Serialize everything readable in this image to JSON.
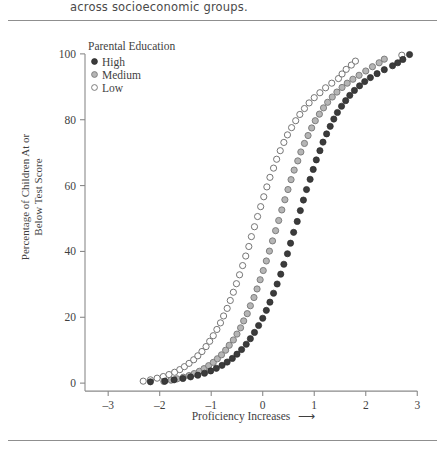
{
  "page": {
    "header_text": "across socioeconomic groups."
  },
  "chart_data": {
    "type": "scatter",
    "title": "",
    "xlabel": "Proficiency Increases",
    "xlabel_arrow": "⟶",
    "ylabel_line1": "Percentage of Children At or",
    "ylabel_line2": "Below Test Score",
    "xlim": [
      -3.45,
      3.15
    ],
    "ylim": [
      -3,
      103
    ],
    "xticks": [
      -3,
      -2,
      -1,
      0,
      1,
      2,
      3
    ],
    "xticklabels": [
      "–3",
      "–2",
      "–1",
      "0",
      "1",
      "2",
      "3"
    ],
    "yticks": [
      0,
      20,
      40,
      60,
      80,
      100
    ],
    "yticklabels": [
      "0",
      "20",
      "40",
      "60",
      "80",
      "100"
    ],
    "grid": false,
    "legend_title": "Parental Education",
    "legend_position": "upper-left-inside",
    "marker_radius": 3.1,
    "series": [
      {
        "name": "High",
        "marker": "filled-dark-circle",
        "fill": "#3b3b3b",
        "stroke": "#2b2b2b",
        "points": [
          [
            -2.18,
            0.4
          ],
          [
            -1.9,
            0.6
          ],
          [
            -1.72,
            1.0
          ],
          [
            -1.55,
            1.4
          ],
          [
            -1.4,
            1.9
          ],
          [
            -1.26,
            2.4
          ],
          [
            -1.13,
            3.0
          ],
          [
            -1.01,
            3.7
          ],
          [
            -0.9,
            4.5
          ],
          [
            -0.79,
            5.4
          ],
          [
            -0.69,
            6.4
          ],
          [
            -0.59,
            7.5
          ],
          [
            -0.5,
            8.8
          ],
          [
            -0.41,
            10.2
          ],
          [
            -0.32,
            11.8
          ],
          [
            -0.24,
            13.5
          ],
          [
            -0.16,
            15.4
          ],
          [
            -0.08,
            17.5
          ],
          [
            0.0,
            19.7
          ],
          [
            0.07,
            22.1
          ],
          [
            0.14,
            24.6
          ],
          [
            0.21,
            27.3
          ],
          [
            0.28,
            30.1
          ],
          [
            0.35,
            33.1
          ],
          [
            0.41,
            36.1
          ],
          [
            0.48,
            39.3
          ],
          [
            0.54,
            42.5
          ],
          [
            0.6,
            45.8
          ],
          [
            0.67,
            49.1
          ],
          [
            0.73,
            52.4
          ],
          [
            0.79,
            55.6
          ],
          [
            0.85,
            58.8
          ],
          [
            0.92,
            61.9
          ],
          [
            0.98,
            64.9
          ],
          [
            1.04,
            67.8
          ],
          [
            1.11,
            70.6
          ],
          [
            1.17,
            73.2
          ],
          [
            1.24,
            75.7
          ],
          [
            1.31,
            78.0
          ],
          [
            1.38,
            80.2
          ],
          [
            1.45,
            82.2
          ],
          [
            1.53,
            84.1
          ],
          [
            1.61,
            85.8
          ],
          [
            1.69,
            87.4
          ],
          [
            1.78,
            88.9
          ],
          [
            1.88,
            90.3
          ],
          [
            1.98,
            91.6
          ],
          [
            2.09,
            92.8
          ],
          [
            2.22,
            94.0
          ],
          [
            2.36,
            95.2
          ],
          [
            2.52,
            96.4
          ],
          [
            2.62,
            97.3
          ],
          [
            2.72,
            98.3
          ],
          [
            2.85,
            99.8
          ]
        ]
      },
      {
        "name": "Medium",
        "marker": "gray-filled-circle",
        "fill": "#b5b5b5",
        "stroke": "#7a7a7a",
        "points": [
          [
            -1.92,
            0.5
          ],
          [
            -1.78,
            0.9
          ],
          [
            -1.66,
            1.3
          ],
          [
            -1.54,
            1.8
          ],
          [
            -1.43,
            2.3
          ],
          [
            -1.33,
            2.9
          ],
          [
            -1.23,
            3.6
          ],
          [
            -1.14,
            4.4
          ],
          [
            -1.05,
            5.3
          ],
          [
            -0.96,
            6.3
          ],
          [
            -0.88,
            7.4
          ],
          [
            -0.8,
            8.6
          ],
          [
            -0.72,
            10.0
          ],
          [
            -0.65,
            11.5
          ],
          [
            -0.57,
            13.1
          ],
          [
            -0.5,
            14.9
          ],
          [
            -0.43,
            16.8
          ],
          [
            -0.37,
            18.9
          ],
          [
            -0.3,
            21.1
          ],
          [
            -0.24,
            23.5
          ],
          [
            -0.17,
            26.0
          ],
          [
            -0.11,
            28.6
          ],
          [
            -0.05,
            31.4
          ],
          [
            0.01,
            34.2
          ],
          [
            0.07,
            37.1
          ],
          [
            0.13,
            40.1
          ],
          [
            0.19,
            43.2
          ],
          [
            0.25,
            46.3
          ],
          [
            0.31,
            49.4
          ],
          [
            0.37,
            52.6
          ],
          [
            0.43,
            55.7
          ],
          [
            0.49,
            58.8
          ],
          [
            0.55,
            61.8
          ],
          [
            0.61,
            64.7
          ],
          [
            0.68,
            67.5
          ],
          [
            0.74,
            70.2
          ],
          [
            0.81,
            72.8
          ],
          [
            0.88,
            75.2
          ],
          [
            0.95,
            77.5
          ],
          [
            1.02,
            79.7
          ],
          [
            1.1,
            81.7
          ],
          [
            1.18,
            83.6
          ],
          [
            1.26,
            85.3
          ],
          [
            1.35,
            86.9
          ],
          [
            1.44,
            88.4
          ],
          [
            1.54,
            89.8
          ],
          [
            1.64,
            91.1
          ],
          [
            1.75,
            92.3
          ],
          [
            1.87,
            93.5
          ],
          [
            2.0,
            94.8
          ],
          [
            2.13,
            96.1
          ],
          [
            2.26,
            97.3
          ],
          [
            2.36,
            98.4
          ]
        ]
      },
      {
        "name": "Low",
        "marker": "open-circle",
        "fill": "#ffffff",
        "stroke": "#6e6e6e",
        "points": [
          [
            -2.32,
            0.6
          ],
          [
            -2.18,
            1.0
          ],
          [
            -2.05,
            1.5
          ],
          [
            -1.93,
            2.0
          ],
          [
            -1.82,
            2.6
          ],
          [
            -1.71,
            3.3
          ],
          [
            -1.61,
            4.1
          ],
          [
            -1.52,
            5.0
          ],
          [
            -1.43,
            6.0
          ],
          [
            -1.34,
            7.1
          ],
          [
            -1.26,
            8.3
          ],
          [
            -1.18,
            9.6
          ],
          [
            -1.1,
            11.1
          ],
          [
            -1.03,
            12.7
          ],
          [
            -0.96,
            14.4
          ],
          [
            -0.89,
            16.3
          ],
          [
            -0.82,
            18.3
          ],
          [
            -0.76,
            20.4
          ],
          [
            -0.69,
            22.7
          ],
          [
            -0.63,
            25.1
          ],
          [
            -0.57,
            27.6
          ],
          [
            -0.51,
            30.2
          ],
          [
            -0.45,
            32.9
          ],
          [
            -0.39,
            35.7
          ],
          [
            -0.33,
            38.6
          ],
          [
            -0.27,
            41.5
          ],
          [
            -0.22,
            44.5
          ],
          [
            -0.16,
            47.5
          ],
          [
            -0.1,
            50.6
          ],
          [
            -0.04,
            53.6
          ],
          [
            0.02,
            56.6
          ],
          [
            0.08,
            59.6
          ],
          [
            0.14,
            62.5
          ],
          [
            0.21,
            65.3
          ],
          [
            0.27,
            68.0
          ],
          [
            0.34,
            70.6
          ],
          [
            0.41,
            73.1
          ],
          [
            0.48,
            75.4
          ],
          [
            0.56,
            77.6
          ],
          [
            0.64,
            79.7
          ],
          [
            0.72,
            81.6
          ],
          [
            0.81,
            83.4
          ],
          [
            0.9,
            85.1
          ],
          [
            1.0,
            86.7
          ],
          [
            1.11,
            88.2
          ],
          [
            1.22,
            89.7
          ],
          [
            1.34,
            91.1
          ],
          [
            1.47,
            92.5
          ],
          [
            1.54,
            93.9
          ],
          [
            1.62,
            95.3
          ],
          [
            1.72,
            96.6
          ],
          [
            1.8,
            97.8
          ],
          [
            2.7,
            99.6
          ]
        ]
      }
    ]
  },
  "legend": {
    "title": "Parental Education",
    "items": [
      {
        "label": "High"
      },
      {
        "label": "Medium"
      },
      {
        "label": "Low"
      }
    ]
  }
}
